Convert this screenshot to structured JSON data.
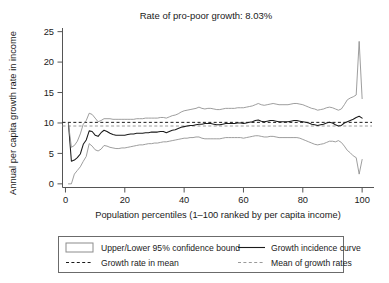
{
  "figure": {
    "title": "Rate of pro-poor growth: 8.03%",
    "background": "#ffffff"
  },
  "colors": {
    "axis": "#555555",
    "gic_line": "#1a1a1a",
    "confidence_band": "#8c8c8c",
    "growth_rate_in_mean": "#1a1a1a",
    "mean_of_growth_rates": "#9a9a9a",
    "text": "#1a1a1a",
    "legend_border": "#6b6b6b"
  },
  "axes": {
    "y": {
      "label": "Annual per capita growth rate in income",
      "ticks": [
        "0",
        "5",
        "10",
        "15",
        "20",
        "25"
      ],
      "tick_values": [
        0,
        5,
        10,
        15,
        20,
        25
      ],
      "range": [
        -0.6,
        25.6
      ]
    },
    "x": {
      "label": "Population percentiles (1–100 ranked by per capita income)",
      "ticks": [
        "0",
        "20",
        "40",
        "60",
        "80",
        "100"
      ],
      "tick_values": [
        0,
        20,
        40,
        60,
        80,
        100
      ],
      "range": [
        -1,
        104
      ]
    }
  },
  "legend": {
    "items": [
      {
        "label": "Upper/Lower 95% confidence bound",
        "marker": "box-outline",
        "color": "#8c8c8c"
      },
      {
        "label": "Growth incidence curve",
        "marker": "solid-line",
        "color": "#1a1a1a"
      },
      {
        "label": "Growth rate in mean",
        "marker": "dashed-line",
        "color": "#1a1a1a"
      },
      {
        "label": "Mean of growth rates",
        "marker": "dashed-line-light",
        "color": "#9a9a9a"
      }
    ]
  },
  "chart_data": {
    "type": "line",
    "title": "Rate of pro-poor growth: 8.03%",
    "xlabel": "Population percentiles (1–100 ranked by per capita income)",
    "ylabel": "Annual per capita growth rate in income",
    "xlim": [
      -1,
      104
    ],
    "ylim": [
      -0.6,
      25.6
    ],
    "grid": false,
    "legend_position": "below-axes",
    "x": [
      1,
      2,
      3,
      4,
      5,
      6,
      7,
      8,
      9,
      10,
      11,
      12,
      13,
      14,
      15,
      16,
      17,
      18,
      19,
      20,
      21,
      22,
      23,
      24,
      25,
      26,
      27,
      28,
      29,
      30,
      31,
      32,
      33,
      34,
      35,
      36,
      37,
      38,
      39,
      40,
      41,
      42,
      43,
      44,
      45,
      46,
      47,
      48,
      49,
      50,
      51,
      52,
      53,
      54,
      55,
      56,
      57,
      58,
      59,
      60,
      61,
      62,
      63,
      64,
      65,
      66,
      67,
      68,
      69,
      70,
      71,
      72,
      73,
      74,
      75,
      76,
      77,
      78,
      79,
      80,
      81,
      82,
      83,
      84,
      85,
      86,
      87,
      88,
      89,
      90,
      91,
      92,
      93,
      94,
      95,
      96,
      97,
      98,
      99,
      100
    ],
    "series": [
      {
        "name": "Growth incidence curve",
        "style": "solid",
        "color": "#1a1a1a",
        "values": [
          9.9,
          3.7,
          3.9,
          4.3,
          4.9,
          6.5,
          7.2,
          8.7,
          8.6,
          8.0,
          7.8,
          8.4,
          8.8,
          8.6,
          8.3,
          8.1,
          8.0,
          8.0,
          8.0,
          8.0,
          8.1,
          8.2,
          8.2,
          8.3,
          8.3,
          8.3,
          8.4,
          8.4,
          8.5,
          8.5,
          8.5,
          8.6,
          8.6,
          8.4,
          8.6,
          8.8,
          8.9,
          9.1,
          9.3,
          9.4,
          9.5,
          9.6,
          9.6,
          9.7,
          9.8,
          9.8,
          9.9,
          9.9,
          9.9,
          9.8,
          9.7,
          9.7,
          9.8,
          9.9,
          9.9,
          9.9,
          9.9,
          10.0,
          10.0,
          9.9,
          10.0,
          10.1,
          10.2,
          10.4,
          10.5,
          10.3,
          10.2,
          10.3,
          10.4,
          10.4,
          10.3,
          10.2,
          10.2,
          10.2,
          10.2,
          10.3,
          10.4,
          10.4,
          10.3,
          10.2,
          10.1,
          10.0,
          9.8,
          9.7,
          9.6,
          9.7,
          9.8,
          10.0,
          10.1,
          10.0,
          9.7,
          9.5,
          9.6,
          10.0,
          10.2,
          10.4,
          10.6,
          10.9,
          11.1,
          10.8
        ]
      },
      {
        "name": "Upper 95% confidence bound",
        "style": "solid",
        "color": "#8c8c8c",
        "values": [
          9.9,
          6.0,
          6.3,
          7.0,
          8.2,
          9.8,
          10.4,
          11.6,
          11.4,
          10.8,
          10.2,
          10.4,
          10.7,
          10.7,
          10.7,
          10.6,
          10.6,
          10.6,
          10.6,
          10.6,
          10.6,
          10.6,
          10.6,
          10.7,
          10.7,
          10.7,
          10.8,
          10.8,
          10.8,
          10.8,
          10.8,
          10.9,
          10.9,
          10.8,
          11.0,
          11.2,
          11.3,
          11.5,
          11.8,
          12.0,
          12.1,
          12.2,
          12.3,
          12.4,
          12.6,
          12.4,
          12.3,
          12.4,
          12.4,
          12.3,
          12.2,
          12.2,
          12.3,
          12.4,
          12.4,
          12.4,
          12.4,
          12.5,
          12.5,
          12.5,
          12.6,
          12.7,
          12.8,
          13.0,
          13.2,
          13.0,
          12.9,
          13.0,
          13.1,
          13.2,
          13.1,
          13.0,
          13.0,
          13.0,
          13.0,
          13.1,
          13.2,
          13.2,
          13.1,
          13.0,
          12.8,
          12.6,
          12.4,
          12.3,
          12.1,
          12.2,
          12.3,
          12.5,
          12.6,
          12.5,
          12.3,
          12.1,
          12.3,
          13.0,
          13.8,
          14.1,
          14.3,
          14.6,
          23.4,
          14.0
        ]
      },
      {
        "name": "Lower 95% confidence bound",
        "style": "solid",
        "color": "#8c8c8c",
        "values": [
          0.0,
          0.0,
          1.6,
          2.2,
          2.8,
          3.7,
          4.5,
          6.6,
          6.2,
          5.6,
          5.4,
          5.7,
          6.3,
          6.2,
          6.0,
          5.9,
          5.8,
          5.8,
          5.9,
          5.9,
          6.0,
          6.1,
          6.2,
          6.3,
          6.4,
          6.4,
          6.5,
          6.6,
          6.6,
          6.7,
          6.7,
          6.8,
          6.9,
          6.9,
          7.0,
          7.1,
          7.2,
          7.3,
          7.4,
          7.5,
          7.5,
          7.6,
          7.6,
          7.7,
          7.7,
          7.5,
          7.4,
          7.4,
          7.4,
          7.4,
          7.4,
          7.4,
          7.5,
          7.6,
          7.6,
          7.6,
          7.6,
          7.6,
          7.6,
          7.5,
          7.6,
          7.7,
          7.8,
          7.9,
          7.9,
          7.8,
          7.7,
          7.7,
          7.8,
          7.8,
          7.7,
          7.6,
          7.6,
          7.6,
          7.6,
          7.6,
          7.6,
          7.6,
          7.5,
          7.3,
          7.1,
          6.9,
          6.7,
          6.5,
          6.4,
          6.5,
          6.6,
          6.8,
          7.0,
          7.0,
          6.9,
          7.1,
          6.8,
          6.2,
          5.5,
          5.1,
          4.6,
          4.3,
          1.6,
          4.0
        ]
      }
    ],
    "hlines": [
      {
        "name": "Growth rate in mean",
        "value": 10.1,
        "style": "dashed",
        "color": "#1a1a1a"
      },
      {
        "name": "Mean of growth rates",
        "value": 9.5,
        "style": "dashed",
        "color": "#9a9a9a"
      }
    ],
    "annotations": [
      {
        "text": "Rate of pro-poor growth: 8.03%",
        "position": "top-center"
      }
    ]
  }
}
